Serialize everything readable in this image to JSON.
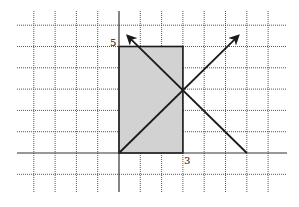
{
  "diagram": {
    "type": "coordinate-grid",
    "grid": {
      "x_min": -4,
      "x_max": 7,
      "y_min": -1,
      "y_max": 6,
      "unit_px": 21.3,
      "origin_px": [
        119,
        153
      ],
      "style": "dotted"
    },
    "rectangle": {
      "x_from": 0,
      "x_to": 3,
      "y_from": 0,
      "y_to": 5,
      "fill": "#d2d2d2"
    },
    "lines": [
      {
        "name": "line-y-equals-x",
        "from": [
          0,
          0
        ],
        "to": [
          5.6,
          5.5
        ],
        "arrow_end": true
      },
      {
        "name": "line-y-equals-6-minus-x",
        "from": [
          6,
          0
        ],
        "to": [
          0.4,
          5.5
        ],
        "arrow_end": true
      }
    ],
    "intersection": [
      3,
      3
    ],
    "labels": {
      "height_label": "5",
      "width_label": "3"
    }
  }
}
